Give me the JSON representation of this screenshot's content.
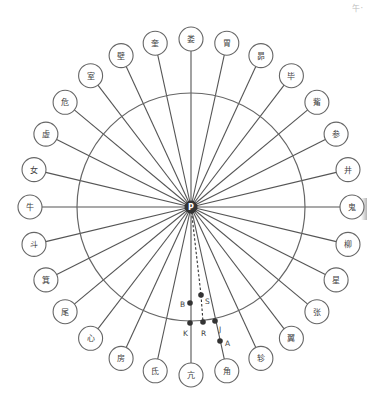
{
  "diagram": {
    "type": "radial lunar mansion diagram",
    "center": {
      "label": "P",
      "x": 191,
      "y": 207
    },
    "main_circle": {
      "cx": 191,
      "cy": 207,
      "r": 114
    },
    "label_ellipse": {
      "rx": 161,
      "ry": 168
    },
    "mansions": [
      "亢",
      "氐",
      "房",
      "心",
      "尾",
      "箕",
      "斗",
      "牛",
      "女",
      "虚",
      "危",
      "室",
      "壁",
      "奎",
      "娄",
      "胃",
      "昴",
      "毕",
      "觜",
      "参",
      "井",
      "鬼",
      "柳",
      "星",
      "张",
      "翼",
      "轸",
      "角"
    ],
    "points": [
      {
        "label": "S",
        "x": 201,
        "y": 295,
        "label_dx": 4,
        "label_dy": 9
      },
      {
        "label": "B",
        "x": 190,
        "y": 303,
        "label_dx": -10,
        "label_dy": 4
      },
      {
        "label": "K",
        "x": 190,
        "y": 323,
        "label_dx": -7,
        "label_dy": 13
      },
      {
        "label": "R",
        "x": 203,
        "y": 322,
        "label_dx": -2,
        "label_dy": 14
      },
      {
        "label": "J",
        "x": 215,
        "y": 321,
        "label_dx": 4,
        "label_dy": 11
      },
      {
        "label": "A",
        "x": 220,
        "y": 341,
        "label_dx": 5,
        "label_dy": 5
      }
    ],
    "dashed_lines": [
      {
        "from": "P",
        "to": "S"
      },
      {
        "from": "S",
        "to": "R"
      }
    ],
    "colors": {
      "line": "#555555",
      "circle": "#666666",
      "point": "#333333",
      "center_fill": "#333333",
      "text": "#444444"
    }
  },
  "corner_mark": {
    "text": "午·"
  }
}
